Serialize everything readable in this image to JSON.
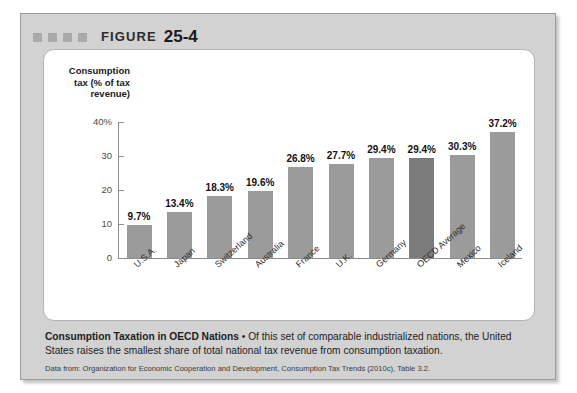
{
  "figure": {
    "label": "FIGURE",
    "number": "25-4"
  },
  "chart_data": {
    "type": "bar",
    "title": "",
    "xlabel": "",
    "ylabel": "Consumption tax (% of tax revenue)",
    "ylim": [
      0,
      40
    ],
    "yticks": [
      "0",
      "10",
      "20",
      "30",
      "40%"
    ],
    "grid": false,
    "legend": null,
    "categories": [
      "U.S.A.",
      "Japan",
      "Switzerland",
      "Australia",
      "France",
      "U.K.",
      "Germany",
      "OECD Average",
      "Mexico",
      "Iceland"
    ],
    "values": [
      9.7,
      13.4,
      18.3,
      19.6,
      26.8,
      27.7,
      29.4,
      29.4,
      30.3,
      37.2
    ],
    "value_labels": [
      "9.7%",
      "13.4%",
      "18.3%",
      "19.6%",
      "26.8%",
      "27.7%",
      "29.4%",
      "29.4%",
      "30.3%",
      "37.2%"
    ],
    "highlight_index": 7,
    "bar_color": "#9b9b9b",
    "highlight_color": "#7b7b7b"
  },
  "caption": {
    "lead": "Consumption Taxation in OECD Nations",
    "separator": " • ",
    "body": "Of this set of comparable industrialized nations, the United States raises the smallest share of total national tax revenue from consumption taxation."
  },
  "source": {
    "text": "Data from: Organization for Economic Cooperation and Development, Consumption Tax Trends (2010c), Table 3.2."
  }
}
